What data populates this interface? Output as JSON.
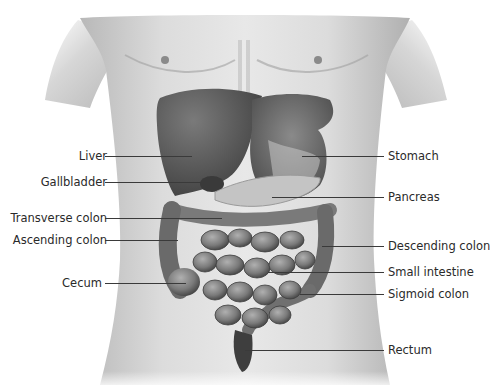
{
  "figure": {
    "type": "anatomical-illustration"
  },
  "labels": {
    "left": [
      {
        "text": "Liver",
        "y": 156,
        "line_end_x": 192
      },
      {
        "text": "Gallbladder",
        "y": 182,
        "line_end_x": 205
      },
      {
        "text": "Transverse colon",
        "y": 218,
        "line_end_x": 222
      },
      {
        "text": "Ascending colon",
        "y": 240,
        "line_end_x": 178
      },
      {
        "text": "Cecum",
        "y": 283,
        "line_end_x": 186
      }
    ],
    "right": [
      {
        "text": "Stomach",
        "y": 156,
        "line_start_x": 302
      },
      {
        "text": "Pancreas",
        "y": 197,
        "line_start_x": 272
      },
      {
        "text": "Descending colon",
        "y": 246,
        "line_start_x": 322
      },
      {
        "text": "Small intestine",
        "y": 272,
        "line_start_x": 268
      },
      {
        "text": "Sigmoid colon",
        "y": 294,
        "line_start_x": 300
      },
      {
        "text": "Rectum",
        "y": 350,
        "line_start_x": 245
      }
    ]
  },
  "colors": {
    "text": "#2a2a2a",
    "leader": "#3a3a3a",
    "skin_light": "#e4e4e4",
    "skin_mid": "#bdbdbd",
    "liver": "#555555",
    "stomach": "#6a6a6a",
    "pancreas": "#bcbcbc",
    "intestine": "#8a8a8a",
    "intestine_dark": "#4a4a4a"
  }
}
